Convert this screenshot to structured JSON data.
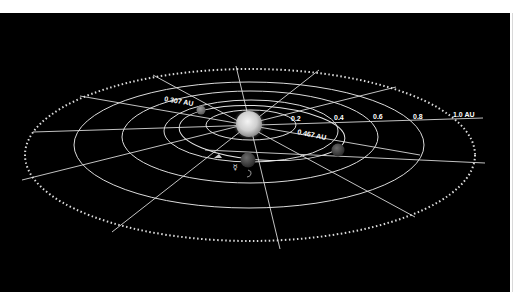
{
  "diagram": {
    "background": "#000000",
    "grid_color": "#dcdcdc",
    "distance_rings": [
      {
        "label": "0.2",
        "au": 0.2
      },
      {
        "label": "0.4",
        "au": 0.4
      },
      {
        "label": "0.6",
        "au": 0.6
      },
      {
        "label": "0.8",
        "au": 0.8
      },
      {
        "label": "1.0 AU",
        "au": 1.0
      }
    ],
    "annotations": {
      "perihelion": "0.307 AU",
      "aphelion": "0.467 AU"
    },
    "bodies": [
      {
        "name": "Sun",
        "icon": "sun-icon"
      },
      {
        "name": "Mercury (perihelion)",
        "icon": "planet-icon"
      },
      {
        "name": "Mercury (aphelion)",
        "icon": "planet-icon"
      },
      {
        "name": "Mercury (current)",
        "icon": "planet-icon"
      }
    ],
    "symbols": {
      "mercury": "☿",
      "marker": "spacecraft-marker"
    }
  }
}
